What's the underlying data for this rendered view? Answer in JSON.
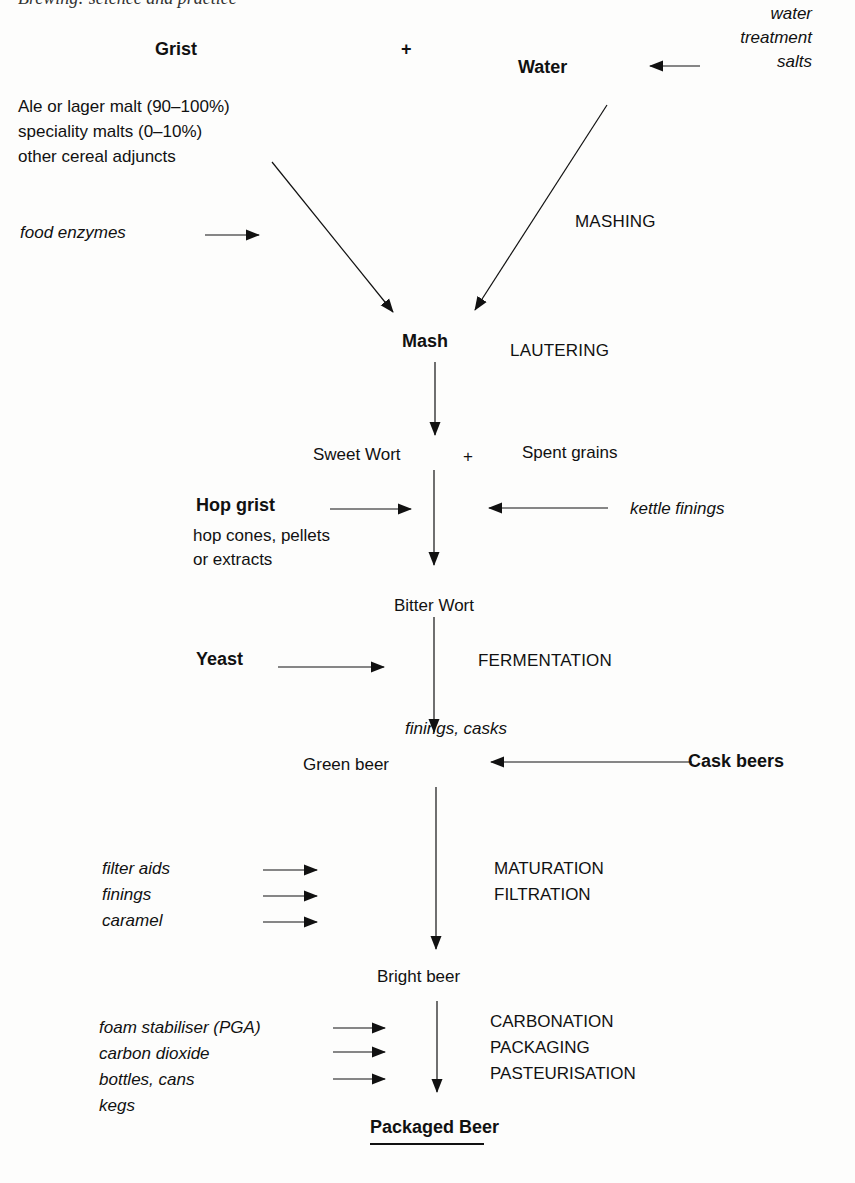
{
  "header": {
    "cut_running_title": "Brewing: science and practice"
  },
  "inputs": {
    "grist": {
      "title": "Grist",
      "lines": [
        "Ale or lager malt (90–100%)",
        "speciality malts (0–10%)",
        "other cereal adjuncts"
      ]
    },
    "plus_1": "+",
    "water": {
      "title": "Water"
    },
    "water_treatment": {
      "lines": [
        "water",
        "treatment",
        "salts"
      ]
    },
    "food_enzymes": "food enzymes"
  },
  "stages": {
    "mashing": "MASHING",
    "mash": "Mash",
    "lautering": "LAUTERING",
    "sweet_wort": "Sweet Wort",
    "plus_2": "+",
    "spent_grains": "Spent grains",
    "hop_grist": {
      "title": "Hop grist",
      "lines": [
        "hop cones, pellets",
        "or extracts"
      ]
    },
    "kettle_finings": "kettle finings",
    "bitter_wort": "Bitter Wort",
    "yeast": "Yeast",
    "fermentation": "FERMENTATION",
    "finings_casks": "finings, casks",
    "green_beer": "Green beer",
    "cask_beers": "Cask beers",
    "maturation_additions": [
      "filter aids",
      "finings",
      "caramel"
    ],
    "maturation_steps": [
      "MATURATION",
      "FILTRATION"
    ],
    "bright_beer": "Bright beer",
    "packaging_additions": [
      "foam stabiliser (PGA)",
      "carbon dioxide",
      "bottles, cans",
      "kegs"
    ],
    "packaging_steps": [
      "CARBONATION",
      "PACKAGING",
      "PASTEURISATION"
    ],
    "packaged_beer": "Packaged Beer"
  },
  "colors": {
    "ink": "#111111",
    "paper": "#fdfdfc"
  }
}
